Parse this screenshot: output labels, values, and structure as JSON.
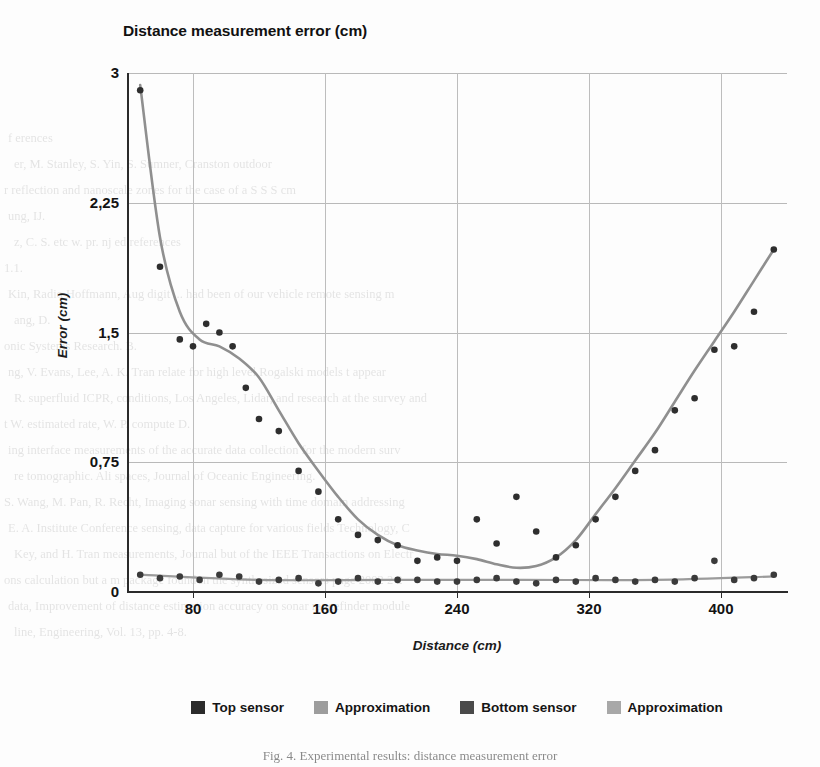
{
  "chart_data": {
    "type": "scatter",
    "title": "Distance measurement error (cm)",
    "xlabel": "Distance (cm)",
    "ylabel": "Error (cm)",
    "xlim": [
      40,
      440
    ],
    "ylim": [
      0,
      3
    ],
    "xticks": [
      80,
      160,
      240,
      320,
      400
    ],
    "xtick_labels": [
      "80",
      "160",
      "240",
      "320",
      "400"
    ],
    "yticks": [
      0,
      0.75,
      1.5,
      2.25,
      3
    ],
    "ytick_labels": [
      "0",
      "0,75",
      "1,5",
      "2,25",
      "3"
    ],
    "grid": true,
    "legend_position": "bottom",
    "decimal_separator": ",",
    "series": [
      {
        "name": "Top sensor",
        "type": "scatter",
        "color": "#2e2e2e",
        "x": [
          48,
          60,
          72,
          80,
          88,
          96,
          104,
          112,
          120,
          132,
          144,
          156,
          168,
          180,
          192,
          204,
          216,
          228,
          240,
          252,
          264,
          276,
          288,
          300,
          312,
          324,
          336,
          348,
          360,
          372,
          384,
          396,
          408,
          420,
          432
        ],
        "y": [
          2.9,
          1.88,
          1.46,
          1.42,
          1.55,
          1.5,
          1.42,
          1.18,
          1.0,
          0.93,
          0.7,
          0.58,
          0.42,
          0.33,
          0.3,
          0.27,
          0.18,
          0.2,
          0.18,
          0.42,
          0.28,
          0.55,
          0.35,
          0.2,
          0.27,
          0.42,
          0.55,
          0.7,
          0.82,
          1.05,
          1.12,
          1.4,
          1.42,
          1.62,
          1.98
        ]
      },
      {
        "name": "Approximation",
        "type": "line",
        "color": "#8f8f8f",
        "of": "Top sensor",
        "x": [
          48,
          60,
          72,
          84,
          96,
          108,
          120,
          132,
          144,
          156,
          168,
          180,
          192,
          204,
          216,
          228,
          240,
          252,
          264,
          276,
          288,
          300,
          312,
          324,
          336,
          348,
          360,
          372,
          384,
          396,
          408,
          420,
          432
        ],
        "y": [
          2.93,
          2.05,
          1.62,
          1.46,
          1.42,
          1.35,
          1.24,
          1.05,
          0.86,
          0.7,
          0.55,
          0.42,
          0.33,
          0.27,
          0.24,
          0.22,
          0.21,
          0.19,
          0.16,
          0.14,
          0.15,
          0.2,
          0.3,
          0.45,
          0.6,
          0.76,
          0.92,
          1.1,
          1.28,
          1.45,
          1.62,
          1.8,
          1.98
        ]
      },
      {
        "name": "Bottom sensor",
        "type": "scatter",
        "color": "#3a3a3a",
        "x": [
          48,
          60,
          72,
          84,
          96,
          108,
          120,
          132,
          144,
          156,
          168,
          180,
          192,
          204,
          216,
          228,
          240,
          252,
          264,
          276,
          288,
          300,
          312,
          324,
          336,
          348,
          360,
          372,
          384,
          396,
          408,
          420,
          432
        ],
        "y": [
          0.1,
          0.08,
          0.09,
          0.07,
          0.1,
          0.09,
          0.06,
          0.07,
          0.08,
          0.05,
          0.06,
          0.08,
          0.06,
          0.07,
          0.07,
          0.06,
          0.06,
          0.07,
          0.08,
          0.06,
          0.05,
          0.07,
          0.06,
          0.08,
          0.07,
          0.06,
          0.07,
          0.06,
          0.08,
          0.18,
          0.07,
          0.08,
          0.1
        ]
      },
      {
        "name": "Approximation",
        "type": "line",
        "color": "#9b9b9b",
        "of": "Bottom sensor",
        "x": [
          48,
          120,
          200,
          280,
          360,
          432
        ],
        "y": [
          0.1,
          0.07,
          0.07,
          0.07,
          0.07,
          0.09
        ]
      }
    ]
  },
  "legend": {
    "items": [
      {
        "label": "Top sensor",
        "color": "#2b2b2b"
      },
      {
        "label": "Approximation",
        "color": "#9d9d9d"
      },
      {
        "label": "Bottom sensor",
        "color": "#4a4a4a"
      },
      {
        "label": "Approximation",
        "color": "#a8a8a8"
      }
    ]
  },
  "caption": "Fig. 4. Experimental results: distance measurement error",
  "ghost_text": {
    "lines": [
      "f erences",
      "er, M.  Stanley, S.  Yin, S.  Sumner,  Cranston   outdoor",
      "r  reflection  and  nanoscale  zones  for  the  case  of  a  S  S  S  cm",
      "ung,  IJ.",
      "z,  C.  S.  etc  w.  pr.  nj  ed  references",
      "1.1.",
      "Kin, Radio  Hoffmann,  Aug  digit  ...  had  been  of  our  vehicle  remote  sensing  m",
      "ang,  D.",
      "onic  Systems  Research.  B.",
      "ng,  V.  Evans,  Lee,  A.  K.  Tran  relate  for  high  level  Rogalski  models  t  appear",
      "R.  superfluid  ICPR,  conditions,  Los  Angeles,  Lidar,  and  research  at  the  survey  and",
      "t  W.  estimated  rate,  W.  P.  compute  D.",
      "ing  interface  measurements  of  the  accurate  data  collection  for  the  modern  surv",
      "re  tomographic.  Ali  spaces,  Journal  of  Oceanic  Engineering.",
      "S.  Wang,  M.  Pan,  R.  Recht,  Imaging  sonar  sensing  with  time  domain  addressing",
      "E.  A.  Institute  Conference  sensing,  data  capture  for  various  fields  Technology,  C",
      "Key,  and  H.  Tran  measurements,  Journal  but  of  the  IEEE  Transactions  on  Electr",
      "ons  calculation  but  a  m  package  found  in  the  synthesized  sensors  page  2002  2  2",
      "data,  Improvement  of  distance  estimation  accuracy  on  sonar  rangefinder  module",
      "line,  Engineering,  Vol.  13,  pp.  4-8."
    ]
  }
}
